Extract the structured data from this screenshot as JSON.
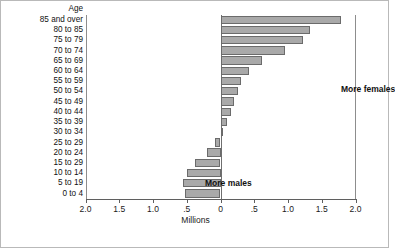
{
  "chart_data": {
    "type": "bar",
    "orientation": "horizontal",
    "title": "",
    "xlabel": "Millions",
    "ylabel": "Age",
    "xlim": [
      -2.0,
      2.0
    ],
    "grid": false,
    "legend": null,
    "xticks": [
      -2.0,
      -1.5,
      -1.0,
      -0.5,
      0,
      0.5,
      1.0,
      1.5,
      2.0
    ],
    "xtick_labels": [
      "2.0",
      "1.5",
      "1.0",
      ".5",
      "0",
      ".5",
      "1.0",
      "1.5",
      "2.0"
    ],
    "categories": [
      "85 and over",
      "80 to 85",
      "75 to 79",
      "70 to 74",
      "65 to 69",
      "60 to 64",
      "55 to 59",
      "50 to 54",
      "45 to 49",
      "40 to 44",
      "35 to 39",
      "30 to 34",
      "25 to 29",
      "20 to 24",
      "15 to 29",
      "10 to 14",
      "5 to 19",
      "0 to 4"
    ],
    "values": [
      1.78,
      1.32,
      1.22,
      0.96,
      0.62,
      0.42,
      0.31,
      0.26,
      0.2,
      0.15,
      0.09,
      0.02,
      -0.08,
      -0.2,
      -0.38,
      -0.5,
      -0.55,
      -0.52
    ],
    "annotations": [
      {
        "text": "More females",
        "x": 0.9,
        "y": "60 to 64"
      },
      {
        "text": "More males",
        "x": -0.85,
        "y": "15 to 29"
      }
    ]
  },
  "axis": {
    "y_header": "Age",
    "x_title": "Millions"
  },
  "colors": {
    "bar_fill": "#a9a9a9",
    "bar_edge": "#6b6b6b",
    "axis": "#5f5f5f",
    "frame": "#b9b9b9",
    "text": "#111111"
  }
}
